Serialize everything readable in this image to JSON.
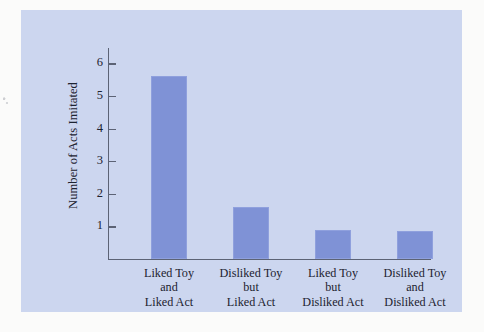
{
  "figure": {
    "panel_background": "#ccd6ef",
    "page_background": "#fbfbfa",
    "bar_color": "#7f92d6",
    "axis_color": "#5c6375",
    "text_color": "#1d2330"
  },
  "chart_data": {
    "type": "bar",
    "title": "",
    "xlabel": "",
    "ylabel": "Number of Acts Imitated",
    "categories": [
      "Liked Toy\nand\nLiked Act",
      "Disliked Toy\nbut\nLiked Act",
      "Liked Toy\nbut\nDisliked Act",
      "Disliked Toy\nand\nDisliked Act"
    ],
    "values": [
      5.6,
      1.58,
      0.9,
      0.85
    ],
    "ylim": [
      0,
      6.4
    ],
    "yticks": [
      1,
      2,
      3,
      4,
      5,
      6
    ],
    "ytick_labels": [
      "1",
      "2",
      "3",
      "4",
      "5",
      "6"
    ],
    "grid": false,
    "legend": false,
    "legend_position": "none"
  }
}
